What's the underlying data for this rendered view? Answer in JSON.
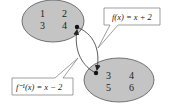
{
  "diagram": {
    "colors": {
      "ellipse_fill": "#c4c4c4",
      "ellipse_stroke": "#555555",
      "arrow": "#333333",
      "callout_fill": "#ffffff",
      "callout_stroke": "#777777"
    },
    "domain_set": {
      "label": "Domain",
      "values": [
        "1",
        "2",
        "3",
        "4"
      ]
    },
    "range_set": {
      "label": "Range",
      "values": [
        "3",
        "4",
        "5",
        "6"
      ]
    },
    "callouts": [
      {
        "id": "f",
        "text": "f(x) = x + 2"
      },
      {
        "id": "f_inverse",
        "text": "f⁻¹(x) = x − 2"
      }
    ]
  }
}
